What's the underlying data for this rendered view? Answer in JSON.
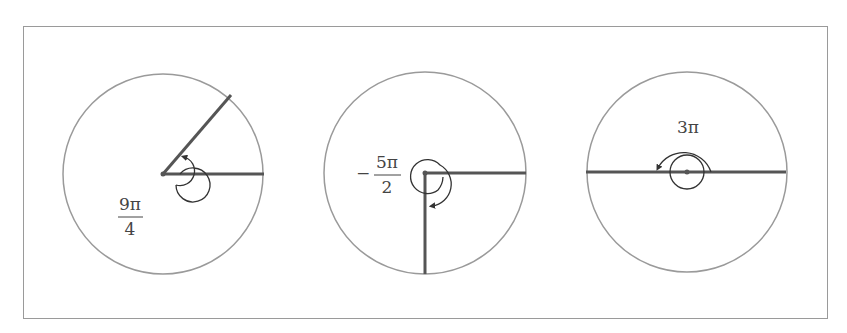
{
  "diagram": {
    "type": "angle-diagrams",
    "panels": [
      {
        "id": "angle-1",
        "label_numerator": "9π",
        "label_denominator": "4",
        "label_sign": "",
        "angle_radians": "9π/4",
        "direction": "counterclockwise",
        "terminal_side": "first quadrant (45°)"
      },
      {
        "id": "angle-2",
        "label_numerator": "5π",
        "label_denominator": "2",
        "label_sign": "−",
        "angle_radians": "-5π/2",
        "direction": "clockwise",
        "terminal_side": "negative y-axis"
      },
      {
        "id": "angle-3",
        "label_text": "3π",
        "angle_radians": "3π",
        "direction": "counterclockwise",
        "terminal_side": "negative x-axis"
      }
    ],
    "colors": {
      "circle": "#9a9a9a",
      "ray": "#555555",
      "arc": "#333333",
      "frame": "#9a9a9a"
    }
  }
}
